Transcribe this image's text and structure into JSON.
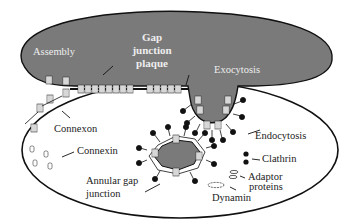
{
  "diagram": {
    "type": "gap junction lifecycle schematic",
    "colors": {
      "upper_cell_fill": "#7a7a7a",
      "lower_cell_fill": "#ffffff",
      "outline": "#111111",
      "label_on_dark": "#eeeeee",
      "label_on_light": "#222222",
      "clathrin": "#111111"
    },
    "labels": {
      "assembly": "Assembly",
      "plaque_line1": "Gap",
      "plaque_line2": "junction",
      "plaque_line3": "plaque",
      "exocytosis": "Exocytosis",
      "connexon": "Connexon",
      "connexin": "Connexin",
      "endocytosis": "Endocytosis",
      "clathrin": "Clathrin",
      "adaptor_line1": "Adaptor",
      "adaptor_line2": "proteins",
      "dynamin": "Dynamin",
      "annular_line1": "Annular gap",
      "annular_line2": "junction"
    }
  }
}
